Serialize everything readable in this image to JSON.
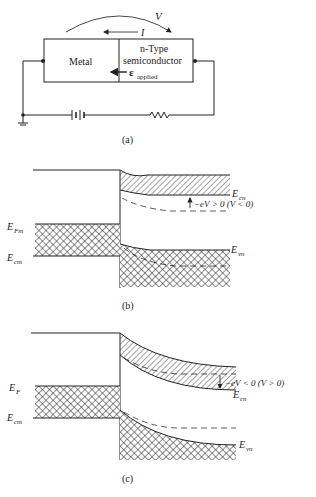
{
  "panel_a": {
    "caption": "(a)",
    "voltage_label": "V",
    "current_label": "I",
    "metal_label": "Metal",
    "semi_label_1": "n-Type",
    "semi_label_2": "semiconductor",
    "field_symbol": "ε",
    "field_sub": "applied"
  },
  "panel_b": {
    "caption": "(b)",
    "label_efm": "E",
    "label_efm_sub": "Fm",
    "label_ecm": "E",
    "label_ecm_sub": "cm",
    "label_ecn": "E",
    "label_ecn_sub": "cn",
    "label_evn": "E",
    "label_evn_sub": "vn",
    "bias_label": "−eV > 0  (V < 0)"
  },
  "panel_c": {
    "caption": "(c)",
    "label_ef": "E",
    "label_ef_sub": "F",
    "label_ecm": "E",
    "label_ecm_sub": "cm",
    "label_ecn": "E",
    "label_ecn_sub": "cn",
    "label_evn": "E",
    "label_evn_sub": "vn",
    "bias_label": "−eV < 0  (V > 0)"
  }
}
